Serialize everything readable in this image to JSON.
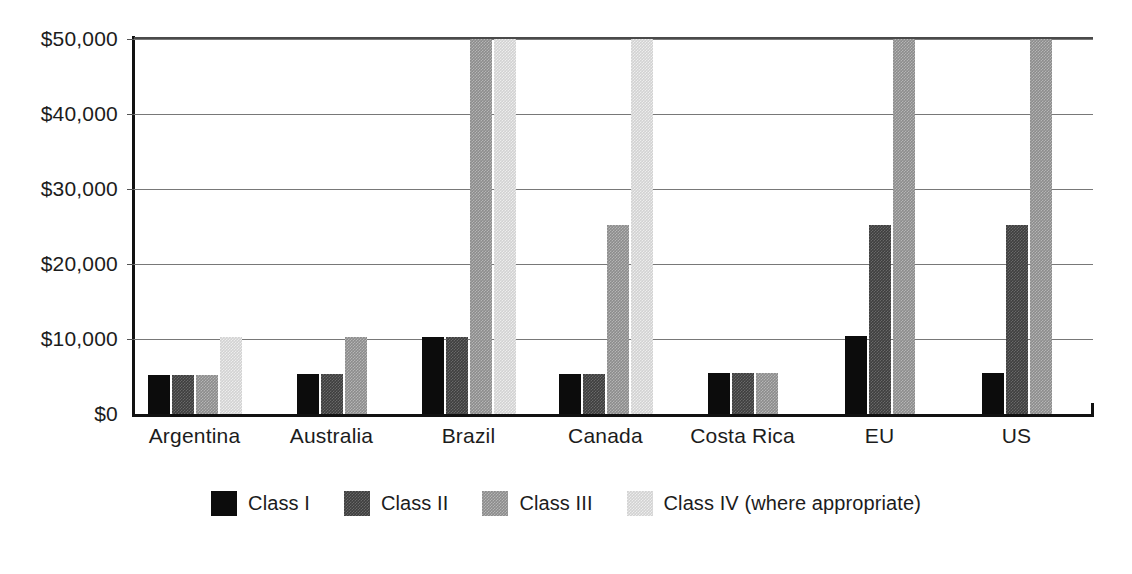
{
  "chart_data": {
    "type": "bar",
    "title": "",
    "subtitle": "",
    "xlabel": "",
    "ylabel": "",
    "grid": true,
    "legend_position": "bottom",
    "ylim": [
      0,
      50000
    ],
    "y_ticks": [
      0,
      10000,
      20000,
      30000,
      40000,
      50000
    ],
    "y_tick_labels": [
      "$0",
      "$10,000",
      "$20,000",
      "$30,000",
      "$40,000",
      "$50,000"
    ],
    "categories": [
      "Argentina",
      "Australia",
      "Brazil",
      "Canada",
      "Costa Rica",
      "EU",
      "US"
    ],
    "series": [
      {
        "name": "Class I",
        "color": "#0c0c0c",
        "values": [
          5200,
          5300,
          10300,
          5400,
          5500,
          10400,
          5500
        ]
      },
      {
        "name": "Class II",
        "color": "#3e3e3e",
        "values": [
          5200,
          5300,
          10300,
          5400,
          5500,
          25200,
          25200
        ]
      },
      {
        "name": "Class III",
        "color": "#8c8c8c",
        "values": [
          5200,
          10300,
          50000,
          25200,
          5500,
          50000,
          50000
        ]
      },
      {
        "name": "Class IV (where appropriate)",
        "color": "#d2d2d2",
        "values": [
          10300,
          null,
          50000,
          50000,
          null,
          null,
          null
        ]
      }
    ],
    "legend_entries": [
      "Class I",
      "Class II",
      "Class III",
      "Class IV (where appropriate)"
    ]
  }
}
